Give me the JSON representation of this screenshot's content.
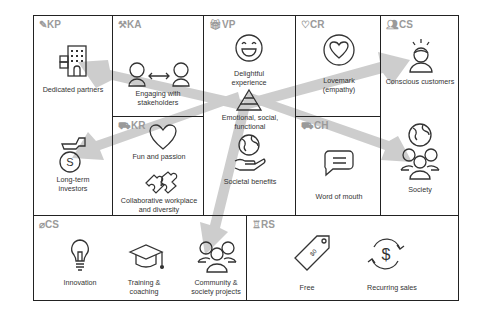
{
  "canvas": {
    "sections": {
      "kp": {
        "code": "KP",
        "icon": "pencil-icon"
      },
      "ka": {
        "code": "KA",
        "icon": "tools-icon"
      },
      "kr": {
        "code": "KR",
        "icon": "truck-icon"
      },
      "vp": {
        "code": "VP",
        "icon": "gift-icon"
      },
      "cr": {
        "code": "CR",
        "icon": "heart-outline-icon"
      },
      "ch": {
        "code": "CH",
        "icon": "truck-icon"
      },
      "cs": {
        "code": "CS",
        "icon": "people-icon"
      },
      "cost": {
        "code": "CS",
        "icon": "tag-icon"
      },
      "rs": {
        "code": "RS",
        "icon": "money-bag-icon"
      }
    },
    "items": {
      "dedicated_partners": "Dedicated partners",
      "long_term_investors": "Long-term investors",
      "engaging_stakeholders": "Engaging with stakeholders",
      "fun_passion": "Fun and passion",
      "collaborative": "Collaborative workplace and diversity",
      "delightful": "Delightful experience",
      "emotional": "Emotional, social, functional",
      "societal": "Societal benefits",
      "lovemark": "Lovemark (empathy)",
      "word_of_mouth": "Word of mouth",
      "conscious_customers": "Conscious customers",
      "society": "Society",
      "innovation": "Innovation",
      "training": "Training & coaching",
      "community": "Community & society projects",
      "free": "Free",
      "recurring": "Recurring sales",
      "price_tag_text": "$0"
    },
    "colors": {
      "border": "#222222",
      "header": "#9a9a9a",
      "arrow": "#c8c8c8",
      "icon_stroke": "#333333"
    }
  }
}
